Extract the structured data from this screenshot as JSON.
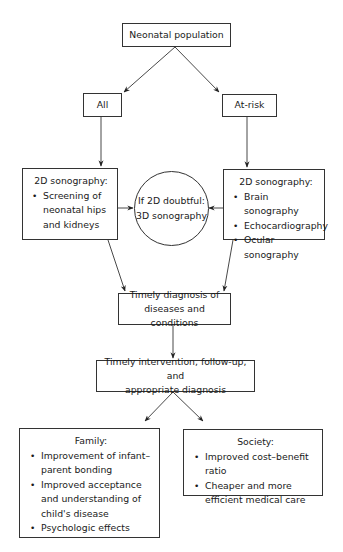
{
  "diagram": {
    "nodes": {
      "root": {
        "label": "Neonatal population"
      },
      "all": {
        "label": "All"
      },
      "at_risk": {
        "label": "At-risk"
      },
      "left_sono": {
        "title": "2D sonography:",
        "items": [
          "Screening of neonatal hips and kidneys"
        ]
      },
      "doubtful": {
        "line1": "If 2D doubtful:",
        "line2": "3D sonography"
      },
      "right_sono": {
        "title": "2D sonography:",
        "items": [
          "Brain sonography",
          "Echocardiography",
          "Ocular sonography"
        ]
      },
      "diagnosis": {
        "line1": "Timely diagnosis of",
        "line2": "diseases and conditions"
      },
      "intervention": {
        "line1": "Timely intervention, follow-up, and",
        "line2": "appropriate diagnosis"
      },
      "family": {
        "title": "Family:",
        "items": [
          "Improvement of infant–parent bonding",
          "Improved acceptance and understanding of child's disease",
          "Psychologic effects"
        ]
      },
      "society": {
        "title": "Society:",
        "items": [
          "Improved cost–benefit ratio",
          "Cheaper and more efficient medical care"
        ]
      }
    },
    "edges": [
      [
        "root",
        "all"
      ],
      [
        "root",
        "at_risk"
      ],
      [
        "all",
        "left_sono"
      ],
      [
        "at_risk",
        "right_sono"
      ],
      [
        "left_sono",
        "doubtful"
      ],
      [
        "right_sono",
        "doubtful"
      ],
      [
        "left_sono",
        "diagnosis"
      ],
      [
        "right_sono",
        "diagnosis"
      ],
      [
        "diagnosis",
        "intervention"
      ],
      [
        "intervention",
        "family"
      ],
      [
        "intervention",
        "society"
      ]
    ],
    "colors": {
      "line": "#333333",
      "text": "#1a1a1a",
      "background": "#ffffff"
    }
  }
}
